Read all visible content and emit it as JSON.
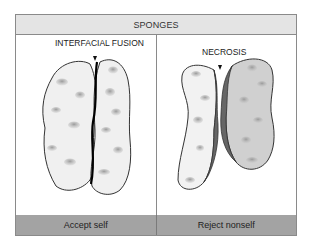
{
  "header": {
    "title": "SPONGES"
  },
  "panels": [
    {
      "label": "INTERFACIAL FUSION",
      "caption": "Accept self",
      "interface_color": "#000000"
    },
    {
      "label": "NECROSIS",
      "caption": "Reject nonself",
      "interface_color": "#555555"
    }
  ],
  "colors": {
    "header_bg": "#e4e4e4",
    "footer_bg": "#a3a3a3",
    "sponge_light": "#f0f0f0",
    "sponge_gray": "#cfcfcf",
    "necrosis": "#666666"
  }
}
